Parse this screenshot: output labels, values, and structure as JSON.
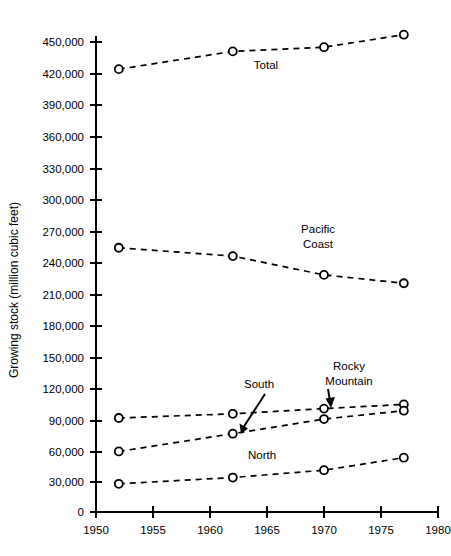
{
  "chart_data": {
    "type": "line",
    "title": "",
    "xlabel": "",
    "ylabel": "Growing stock (million cubic feet)",
    "xlim": [
      1950,
      1980
    ],
    "ylim": [
      0,
      450000
    ],
    "grid": false,
    "legend": "inline-annotations",
    "x_ticks": [
      "1950",
      "1955",
      "1960",
      "1965",
      "1970",
      "1975",
      "1980"
    ],
    "x_tick_values": [
      1950,
      1955,
      1960,
      1965,
      1970,
      1975,
      1980
    ],
    "y_ticks": [
      "0",
      "30,000",
      "60,000",
      "90,000",
      "120,000",
      "150,000",
      "180,000",
      "210,000",
      "240,000",
      "270,000",
      "300,000",
      "330,000",
      "360,000",
      "390,000",
      "420,000",
      "450,000"
    ],
    "y_tick_values": [
      0,
      30000,
      60000,
      90000,
      120000,
      150000,
      180000,
      210000,
      240000,
      270000,
      300000,
      330000,
      360000,
      390000,
      420000,
      450000
    ],
    "x": [
      1952,
      1962,
      1970,
      1977
    ],
    "series": [
      {
        "name": "Total",
        "label": "Total",
        "values": [
          424000,
          441000,
          445000,
          457000
        ]
      },
      {
        "name": "Pacific Coast",
        "label": "Pacific\nCoast",
        "label_line1": "Pacific",
        "label_line2": "Coast",
        "values": [
          253000,
          245000,
          227000,
          219000
        ]
      },
      {
        "name": "Rocky Mountain",
        "label": "Rocky\nMountain",
        "label_line1": "Rocky",
        "label_line2": "Mountain",
        "values": [
          90000,
          94000,
          99000,
          103000
        ]
      },
      {
        "name": "South",
        "label": "South",
        "values": [
          58000,
          75000,
          89000,
          97000
        ]
      },
      {
        "name": "North",
        "label": "North",
        "values": [
          27000,
          33000,
          40000,
          52000
        ]
      }
    ]
  },
  "axis": {
    "y_title": "Growing stock (million cubic feet)"
  },
  "annotations": {
    "total": "Total",
    "pacific_line1": "Pacific",
    "pacific_line2": "Coast",
    "south": "South",
    "rocky_line1": "Rocky",
    "rocky_line2": "Mountain",
    "north": "North"
  },
  "colors": {
    "ink": "#000000",
    "background": "#ffffff"
  }
}
